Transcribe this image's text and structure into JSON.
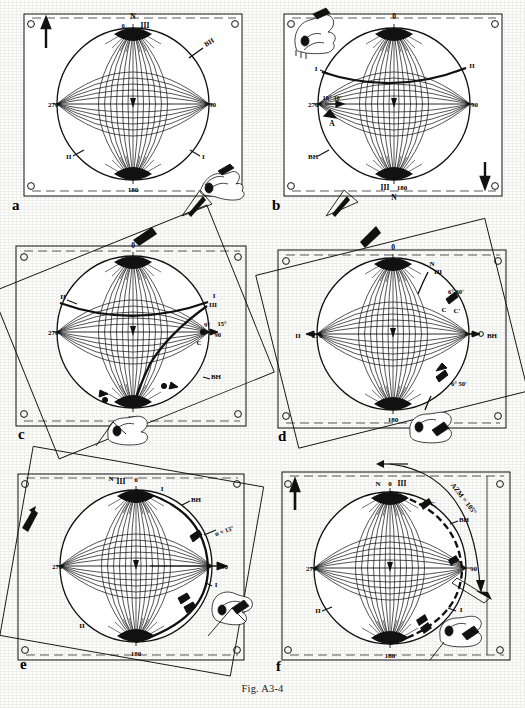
{
  "figure": {
    "caption": "Fig. A3-4",
    "page_width": 525,
    "page_height": 708,
    "ink_color": "#111111",
    "paper_color": "#fdfdfb"
  },
  "panels": [
    {
      "id": "a",
      "letter": "a",
      "overlay_rotation_deg": 0,
      "net_labels": {
        "top": "N",
        "top_secondary": "III",
        "top_degrees": "0",
        "left": "270",
        "right": "90",
        "bottom": "180"
      },
      "annotations": [
        {
          "name": "bh-label",
          "text": "BH",
          "position": "upper-right"
        },
        {
          "name": "axis-ii-label",
          "text": "II",
          "position": "lower-left"
        },
        {
          "name": "axis-i-label",
          "text": "I",
          "position": "lower-right"
        }
      ],
      "has_north_arrow": true,
      "north_arrow_direction": "up",
      "north_arrow_corner": "top-left",
      "has_hand_icon": true,
      "hand_icon_corner": "bottom-right",
      "has_pointer_arrow": true,
      "great_circle": false,
      "center_marker": true
    },
    {
      "id": "b",
      "letter": "b",
      "overlay_rotation_deg": 0,
      "net_labels": {
        "top": "0",
        "left": "270",
        "right": "90",
        "bottom": "180",
        "bottom_secondary": "III",
        "bottom_tertiary": "N"
      },
      "annotations": [
        {
          "name": "axis-i-label",
          "text": "I",
          "position": "upper-left"
        },
        {
          "name": "axis-ii-label",
          "text": "II",
          "position": "upper-right"
        },
        {
          "name": "bh-label",
          "text": "BH",
          "position": "lower-left"
        },
        {
          "name": "angle-label",
          "text": "18° 30'",
          "position": "left-of-center"
        },
        {
          "name": "point-a-label",
          "text": "A",
          "position": "left-of-center-below"
        }
      ],
      "has_north_arrow": true,
      "north_arrow_direction": "down",
      "north_arrow_corner": "bottom-right",
      "has_hand_icon": true,
      "hand_icon_corner": "top-left",
      "has_pointer_arrow": true,
      "great_circle": true,
      "center_marker": true
    },
    {
      "id": "c",
      "letter": "c",
      "overlay_rotation_deg": -22,
      "net_labels": {
        "top": "0",
        "left": "270",
        "right": "90",
        "bottom": "180"
      },
      "annotations": [
        {
          "name": "axis-ii-label",
          "text": "II",
          "position": "upper-left"
        },
        {
          "name": "axis-i-label",
          "text": "I",
          "position": "upper-right"
        },
        {
          "name": "axis-iii-label",
          "text": "III",
          "position": "upper-right-lower"
        },
        {
          "name": "angle-label-1",
          "text": "9°",
          "position": "right-of-center"
        },
        {
          "name": "angle-label-2",
          "text": "15°",
          "position": "right-edge"
        },
        {
          "name": "point-c-label",
          "text": "C",
          "position": "right-of-center-below"
        },
        {
          "name": "bh-label",
          "text": "BH",
          "position": "lower-right"
        }
      ],
      "has_north_arrow": true,
      "north_arrow_direction": "up-right",
      "north_arrow_corner": "overlay-top",
      "has_hand_icon": true,
      "hand_icon_corner": "bottom-center",
      "great_circle": true,
      "second_curve": true,
      "center_marker": true
    },
    {
      "id": "d",
      "letter": "d",
      "overlay_rotation_deg": -14,
      "net_labels": {
        "top": "0",
        "left": "270",
        "right": "90",
        "bottom": "180"
      },
      "annotations": [
        {
          "name": "north-label",
          "text": "N",
          "position": "upper-right"
        },
        {
          "name": "axis-iii-label",
          "text": "III",
          "position": "upper-right"
        },
        {
          "name": "angle-label-1",
          "text": "6° 30'",
          "position": "upper-right-inner"
        },
        {
          "name": "point-c-label",
          "text": "C",
          "position": "upper-right-inner-below"
        },
        {
          "name": "point-c-prime-label",
          "text": "C'",
          "position": "upper-right-inner-below-2"
        },
        {
          "name": "axis-ii-label",
          "text": "II",
          "position": "left-edge"
        },
        {
          "name": "bh-label",
          "text": "BH",
          "position": "right-edge"
        },
        {
          "name": "angle-label-2",
          "text": "6° 50'",
          "position": "lower-right"
        },
        {
          "name": "axis-i-label",
          "text": "I",
          "position": "bottom-right"
        }
      ],
      "has_north_arrow": true,
      "north_arrow_direction": "up-right",
      "north_arrow_corner": "overlay-top",
      "has_hand_icon": true,
      "hand_icon_corner": "bottom-center-right",
      "great_circle": false,
      "center_marker": true
    },
    {
      "id": "e",
      "letter": "e",
      "overlay_rotation_deg": 10,
      "net_labels": {
        "top": "0",
        "top_secondary": "N",
        "top_tertiary": "III",
        "left": "270",
        "right": "90",
        "bottom": "180"
      },
      "annotations": [
        {
          "name": "axis-i-label",
          "text": "I",
          "position": "top-right"
        },
        {
          "name": "bh-label",
          "text": "BH",
          "position": "upper-right"
        },
        {
          "name": "alpha-angle-label",
          "text": "α = 13°",
          "position": "right-upper"
        },
        {
          "name": "axis-i-label-2",
          "text": "I",
          "position": "right-lower"
        },
        {
          "name": "axis-ii-label",
          "text": "II",
          "position": "lower-left"
        }
      ],
      "has_north_arrow": true,
      "north_arrow_direction": "up",
      "north_arrow_corner": "overlay-left",
      "has_hand_icon": true,
      "hand_icon_corner": "bottom-right",
      "has_pointer_arrow": true,
      "great_circle": true,
      "center_marker": true
    },
    {
      "id": "f",
      "letter": "f",
      "overlay_rotation_deg": 0,
      "net_labels": {
        "top": "0",
        "top_secondary": "N",
        "top_tertiary": "III",
        "left": "270",
        "right": "90",
        "bottom": "180"
      },
      "annotations": [
        {
          "name": "azimuth-label",
          "text": "AZM = 105°",
          "position": "outer-arc"
        },
        {
          "name": "point-c-label",
          "text": "C",
          "position": "upper-right"
        },
        {
          "name": "bh-label",
          "text": "BH",
          "position": "upper-right-lower"
        },
        {
          "name": "point-a-label",
          "text": "A",
          "position": "right-of-center"
        },
        {
          "name": "axis-i-label",
          "text": "I",
          "position": "lower-right"
        },
        {
          "name": "axis-ii-label",
          "text": "II",
          "position": "lower-left"
        }
      ],
      "has_north_arrow": true,
      "north_arrow_direction": "up",
      "north_arrow_corner": "top-left",
      "has_hand_icon": true,
      "hand_icon_corner": "bottom-right",
      "has_azimuth_arc": true,
      "great_circle": true,
      "center_marker": true
    }
  ]
}
